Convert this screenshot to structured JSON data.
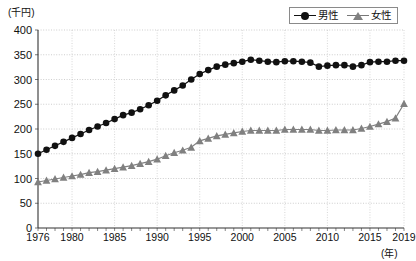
{
  "chart_data": {
    "type": "line",
    "title": "",
    "subtitle": "",
    "xlabel": "(年)",
    "ylabel": "(千円)",
    "ylim": [
      0,
      400
    ],
    "xlim": [
      1976,
      2019
    ],
    "yticks": [
      0,
      50,
      100,
      150,
      200,
      250,
      300,
      350,
      400
    ],
    "xticks": [
      1976,
      1980,
      1985,
      1990,
      1995,
      2000,
      2005,
      2010,
      2015,
      2019
    ],
    "grid": true,
    "legend_position": "top-right",
    "x": [
      1976,
      1977,
      1978,
      1979,
      1980,
      1981,
      1982,
      1983,
      1984,
      1985,
      1986,
      1987,
      1988,
      1989,
      1990,
      1991,
      1992,
      1993,
      1994,
      1995,
      1996,
      1997,
      1998,
      1999,
      2000,
      2001,
      2002,
      2003,
      2004,
      2005,
      2006,
      2007,
      2008,
      2009,
      2010,
      2011,
      2012,
      2013,
      2014,
      2015,
      2016,
      2017,
      2018,
      2019
    ],
    "series": [
      {
        "name": "男性",
        "marker": "circle",
        "color": "#111111",
        "values": [
          150,
          158,
          166,
          174,
          182,
          190,
          198,
          205,
          212,
          220,
          228,
          233,
          240,
          248,
          257,
          268,
          278,
          288,
          300,
          311,
          319,
          326,
          330,
          333,
          336,
          340,
          338,
          336,
          335,
          337,
          337,
          336,
          334,
          326,
          328,
          329,
          329,
          326,
          329,
          335,
          336,
          336,
          338,
          338
        ]
      },
      {
        "name": "女性",
        "marker": "triangle",
        "color": "#808080",
        "values": [
          93,
          96,
          99,
          102,
          105,
          108,
          112,
          114,
          117,
          120,
          123,
          126,
          130,
          134,
          139,
          146,
          152,
          157,
          163,
          176,
          181,
          186,
          189,
          192,
          195,
          197,
          197,
          197,
          197,
          199,
          199,
          199,
          199,
          197,
          197,
          198,
          198,
          198,
          201,
          205,
          210,
          215,
          222,
          251
        ]
      }
    ]
  },
  "axes": {
    "y_unit_label": "(千円)",
    "x_unit_label": "(年)"
  },
  "legend": {
    "items": [
      {
        "label": "男性",
        "marker": "circle-marker",
        "color": "#111111"
      },
      {
        "label": "女性",
        "marker": "triangle-marker",
        "color": "#808080"
      }
    ]
  }
}
